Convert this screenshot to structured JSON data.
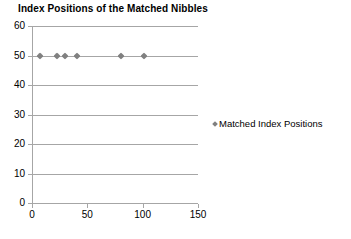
{
  "chart_data": {
    "type": "scatter",
    "title": "Index Positions of the Matched Nibbles",
    "xlabel": "",
    "ylabel": "",
    "xlim": [
      0,
      150
    ],
    "ylim": [
      0,
      60
    ],
    "xticks": [
      0,
      50,
      100,
      150
    ],
    "yticks": [
      0,
      10,
      20,
      30,
      40,
      50,
      60
    ],
    "grid": true,
    "legend_position": "right",
    "marker_color": "#808080",
    "gridline_color": "#a6a6a6",
    "series": [
      {
        "name": "Matched Index Positions",
        "marker": "diamond",
        "points": [
          {
            "x": 7,
            "y": 50
          },
          {
            "x": 23,
            "y": 50
          },
          {
            "x": 30,
            "y": 50
          },
          {
            "x": 41,
            "y": 50
          },
          {
            "x": 80,
            "y": 50
          },
          {
            "x": 101,
            "y": 50
          }
        ]
      }
    ]
  },
  "axis": {
    "y_tick_labels": [
      "0",
      "10",
      "20",
      "30",
      "40",
      "50",
      "60"
    ],
    "x_tick_labels": [
      "0",
      "50",
      "100",
      "150"
    ]
  },
  "legend": {
    "entries": [
      {
        "label": "Matched Index Positions",
        "marker_icon": "diamond-marker-icon"
      }
    ]
  }
}
